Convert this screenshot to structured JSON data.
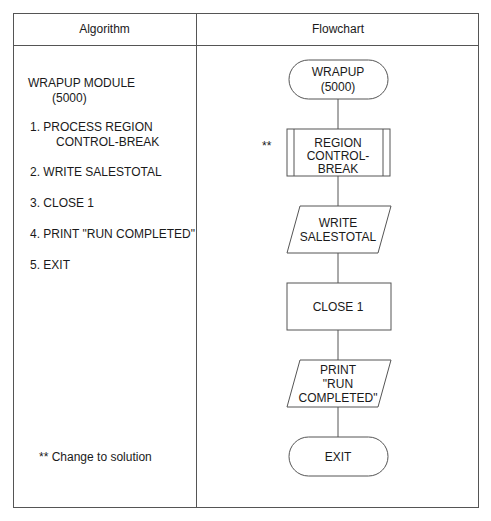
{
  "table": {
    "headers": {
      "algorithm": "Algorithm",
      "flowchart": "Flowchart"
    }
  },
  "algorithm": {
    "title_line1": "WRAPUP MODULE",
    "title_line2": "(5000)",
    "steps": [
      {
        "line1": "1. PROCESS REGION",
        "line2": "CONTROL-BREAK"
      },
      {
        "line1": "2. WRITE SALESTOTAL"
      },
      {
        "line1": "3. CLOSE 1"
      },
      {
        "line1": "4. PRINT \"RUN COMPLETED\""
      },
      {
        "line1": "5. EXIT"
      }
    ],
    "footnote": "** Change to solution"
  },
  "flowchart": {
    "nodes": [
      {
        "type": "terminal",
        "lines": [
          "WRAPUP",
          "(5000)"
        ]
      },
      {
        "type": "predefined-process",
        "lines": [
          "REGION",
          "CONTROL-",
          "BREAK"
        ],
        "marker": "**"
      },
      {
        "type": "input-output",
        "lines": [
          "WRITE",
          "SALESTOTAL"
        ]
      },
      {
        "type": "process",
        "lines": [
          "CLOSE 1"
        ]
      },
      {
        "type": "input-output",
        "lines": [
          "PRINT",
          "\"RUN",
          "COMPLETED\""
        ]
      },
      {
        "type": "terminal",
        "lines": [
          "EXIT"
        ]
      }
    ]
  }
}
